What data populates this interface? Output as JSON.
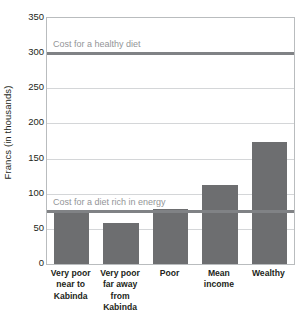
{
  "chart_data": {
    "type": "bar",
    "title": "",
    "subtitle": "",
    "xlabel": "",
    "ylabel": "Francs (in thousands)",
    "categories": [
      "Very poor near to Kabinda",
      "Very poor far away from Kabinda",
      "Poor",
      "Mean income",
      "Wealthy"
    ],
    "category_lines": [
      [
        "Very poor",
        "near to",
        "Kabinda"
      ],
      [
        "Very poor",
        "far away",
        "from Kabinda"
      ],
      [
        "Poor"
      ],
      [
        "Mean",
        "income"
      ],
      [
        "Wealthy"
      ]
    ],
    "values": [
      72,
      59,
      78,
      113,
      174
    ],
    "ylim": [
      0,
      350
    ],
    "yticks": [
      0,
      50,
      100,
      150,
      200,
      250,
      300,
      350
    ],
    "ytick_labels": [
      "0",
      "50",
      "100",
      "150",
      "200",
      "250",
      "300",
      "350"
    ],
    "grid": true,
    "legend": "none",
    "bar_color": "#6d6e70",
    "gridline_color": "#d4d6d8",
    "axis_color": "#b9bcbe",
    "reference_lines": [
      {
        "label": "Cost for a healthy diet",
        "value": 300,
        "color": "#808285",
        "label_color": "#939598"
      },
      {
        "label": "Cost for a diet rich in energy",
        "value": 76,
        "color": "#808285",
        "label_color": "#939598"
      }
    ]
  }
}
